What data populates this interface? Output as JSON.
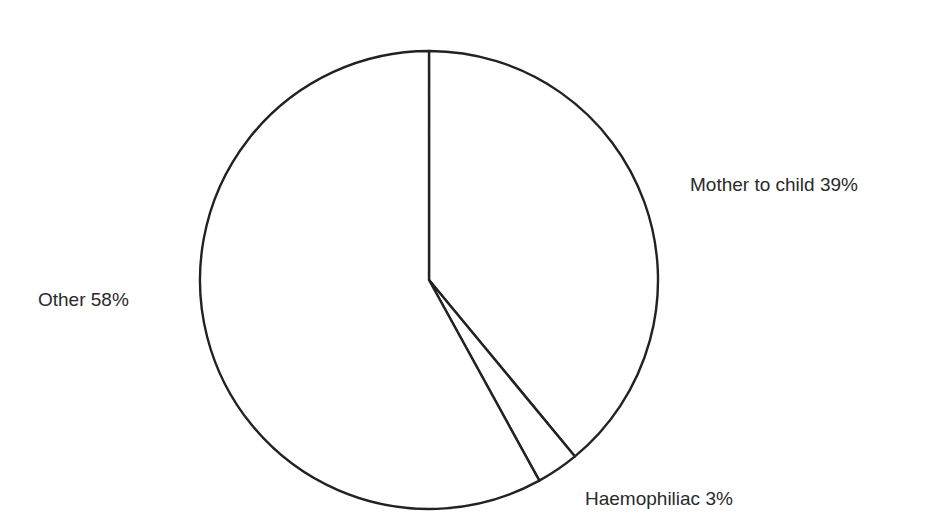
{
  "chart_data": {
    "type": "pie",
    "title": "",
    "labels": [
      "Mother to child",
      "Haemophiliac",
      "Other"
    ],
    "values": [
      39,
      3,
      58
    ],
    "unit": "%",
    "start_angle_deg": 0,
    "direction": "clockwise",
    "legend": "none",
    "slice_labels": [
      "Mother to child 39%",
      "Haemophiliac 3%",
      "Other 58%"
    ],
    "colors": {
      "fill": "#ffffff",
      "stroke": "#222222"
    }
  }
}
